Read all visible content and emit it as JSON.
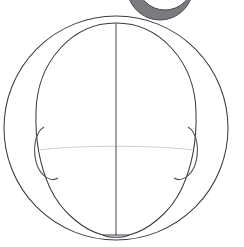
{
  "figure": {
    "view": "front view",
    "background_color": "#ffffff",
    "canvas": {
      "width": 244,
      "height": 247
    },
    "line_colors": {
      "primary_outline": "#3b3b42",
      "secondary_outline": "#55555d",
      "faint_guideline": "#cfcfd4",
      "crescent_fill": "#7a7a80"
    },
    "elements": [
      {
        "name": "top-cropped-crescent",
        "label": "Cropped dark arc (partial circle from figure above)",
        "center_x": 160,
        "center_y": -12,
        "radius": 32,
        "note": "clipped by top edge of image"
      },
      {
        "name": "outer-circle",
        "label": "Outer construction circle",
        "center_x": 116,
        "center_y": 128,
        "radius_x": 112,
        "radius_y": 112,
        "top": 16,
        "bottom": 240,
        "left": 4,
        "right": 228
      },
      {
        "name": "head-oval",
        "label": "Egg-shaped skull and face outline",
        "center_x": 116,
        "top": 23,
        "bottom": 237,
        "left": 36,
        "right": 196,
        "widest_y": 118
      },
      {
        "name": "vertical-centerline",
        "label": "Vertical center axis of face",
        "x": 116,
        "y_start": 23,
        "y_end": 237
      },
      {
        "name": "horizontal-eyeline",
        "label": "Faint horizontal eye-level guideline",
        "y": 148,
        "x_start": 48,
        "x_end": 186,
        "style": "faint"
      },
      {
        "name": "left-ear",
        "label": "Left ear (viewer left)",
        "top_y": 126,
        "bottom_y": 178,
        "outer_x": 36,
        "inner_x": 58
      },
      {
        "name": "right-ear",
        "label": "Right ear (viewer right)",
        "top_y": 126,
        "bottom_y": 178,
        "outer_x": 196,
        "inner_x": 174
      },
      {
        "name": "left-jawline",
        "label": "Left jaw line from ear to chin"
      },
      {
        "name": "right-jawline",
        "label": "Right jaw line from ear to chin"
      },
      {
        "name": "chin",
        "label": "Rounded chin base",
        "y": 235,
        "width": 26
      }
    ]
  }
}
